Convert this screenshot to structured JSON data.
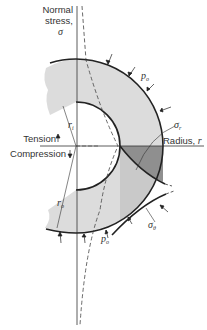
{
  "diagram": {
    "labels": {
      "y_axis_line1": "Normal",
      "y_axis_line2": "stress,",
      "y_axis_symbol": "σ",
      "x_axis": "Radius, ",
      "x_axis_symbol": "r",
      "tension": "Tension",
      "compression": "Compression",
      "inner_radius": "r",
      "inner_radius_sub": "i",
      "outer_radius": "r",
      "outer_radius_sub": "o",
      "pressure_top": "p",
      "pressure_top_sub": "o",
      "pressure_bottom": "p",
      "pressure_bottom_sub": "o",
      "radial_stress": "σ",
      "radial_stress_sub": "r",
      "hoop_stress": "σ",
      "hoop_stress_sub": "θ"
    },
    "colors": {
      "light_fill": "#d9d9d9",
      "mid_fill": "#c8c8c8",
      "dark_fill": "#8f8f8f",
      "line": "#222222"
    }
  }
}
